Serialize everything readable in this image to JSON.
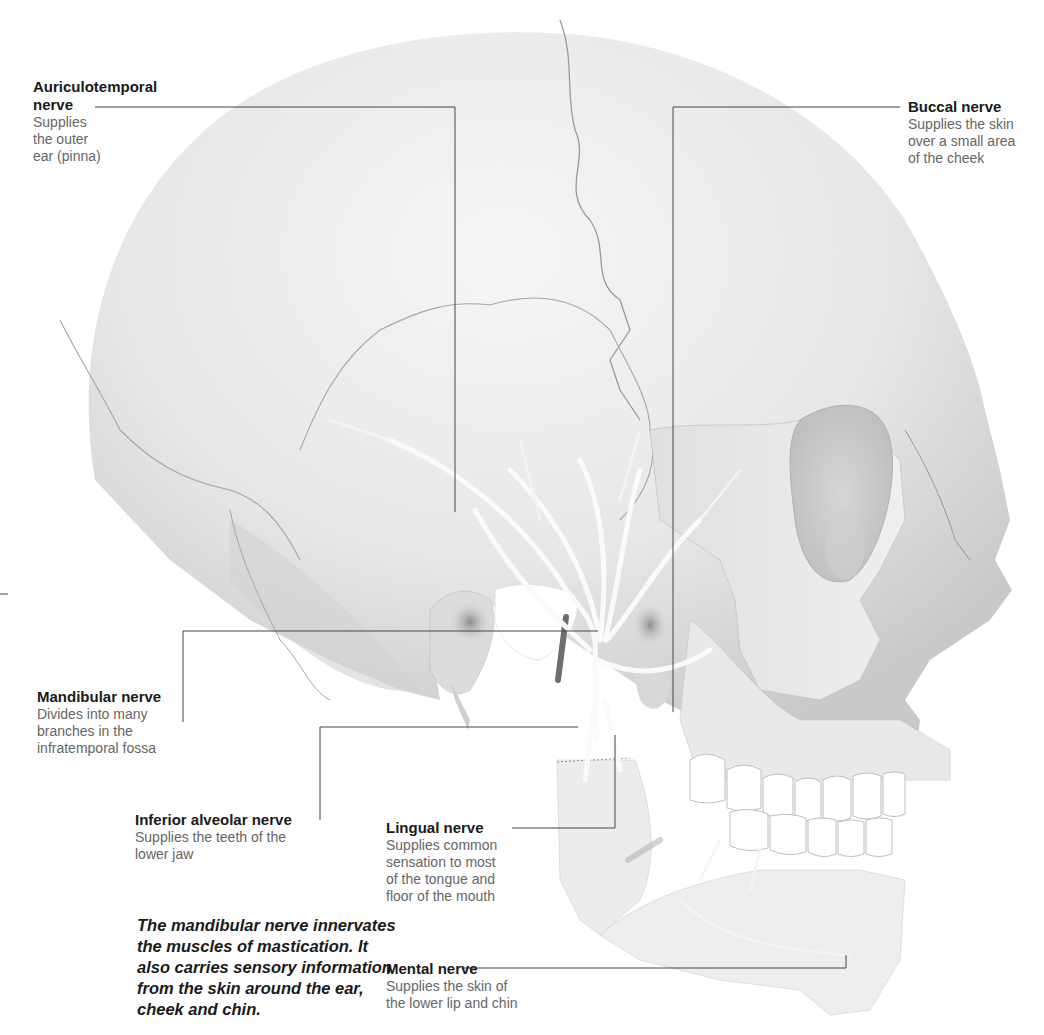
{
  "figure": {
    "colors": {
      "background": "#ffffff",
      "bone": "#e6e6e6",
      "bone_shadow": "#bcbcbc",
      "nerve": "#f7f7f7",
      "leader_line": "#444444",
      "title_text": "#1a1a1a",
      "desc_text": "#666666"
    }
  },
  "labels": [
    {
      "id": "auriculotemporal",
      "title": "Auriculotemporal nerve",
      "title_line1": "Auriculotemporal",
      "title_line2": "nerve",
      "desc_lines": [
        "Supplies",
        "the outer",
        "ear (pinna)"
      ]
    },
    {
      "id": "buccal",
      "title": "Buccal nerve",
      "desc_lines": [
        "Supplies the skin",
        "over a small area",
        "of the cheek"
      ]
    },
    {
      "id": "mandibular",
      "title": "Mandibular nerve",
      "desc_lines": [
        "Divides into many",
        "branches in the",
        "infratemporal fossa"
      ]
    },
    {
      "id": "inferior_alveolar",
      "title": "Inferior alveolar nerve",
      "desc_lines": [
        "Supplies the teeth of the",
        "lower jaw"
      ]
    },
    {
      "id": "lingual",
      "title": "Lingual nerve",
      "desc_lines": [
        "Supplies common",
        "sensation to most",
        "of the tongue and",
        "floor of the mouth"
      ]
    },
    {
      "id": "mental",
      "title": "Mental nerve",
      "desc_lines": [
        "Supplies the skin of",
        "the lower lip and chin"
      ]
    }
  ],
  "caption": "The mandibular nerve innervates the muscles of mastication. It also carries sensory information from the skin around the ear, cheek and chin."
}
